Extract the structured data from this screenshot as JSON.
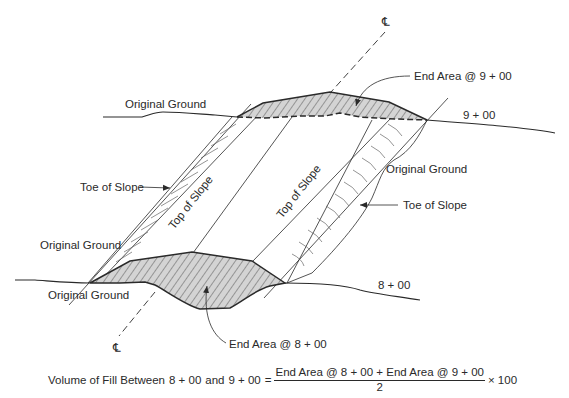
{
  "diagram": {
    "centerline_symbol_top": "℄",
    "centerline_symbol_bottom": "℄",
    "labels": {
      "original_ground_top_left": "Original Ground",
      "original_ground_mid_left": "Original Ground",
      "original_ground_bottom_left": "Original Ground",
      "original_ground_right": "Original Ground",
      "toe_of_slope_left": "Toe of Slope",
      "toe_of_slope_right": "Toe of Slope",
      "top_of_slope_left": "Top of Slope",
      "top_of_slope_right": "Top of Slope",
      "end_area_top": "End Area @ 9 + 00",
      "end_area_bottom": "End Area @ 8 + 00",
      "station_top": "9 + 00",
      "station_bottom": "8 + 00"
    },
    "colors": {
      "line": "#2a2a2a",
      "fill_hatch_bg": "#d4d4d4",
      "hatch": "#555555"
    }
  },
  "formula": {
    "lhs": "Volume of Fill Between",
    "station_a": "8 + 00",
    "and": "and",
    "station_b": "9 + 00",
    "equals": "=",
    "numerator": "End Area @ 8 + 00 + End Area @ 9 + 00",
    "denominator": "2",
    "multiplier": "× 100"
  }
}
